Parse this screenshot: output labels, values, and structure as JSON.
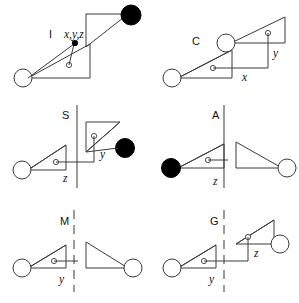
{
  "figure": {
    "background_color": "#ffffff",
    "line_color": "#3a3a3a",
    "filled_marker_color": "#000000",
    "open_marker_color": "#ffffff",
    "width": 299,
    "height": 303
  },
  "panels": [
    {
      "id": "panel-i",
      "operation_label": "I",
      "axis_labels": [
        "x,y,z"
      ],
      "divider": "none",
      "motifs": [
        {
          "name": "motif-base",
          "handedness": "right",
          "marker": "open-circle",
          "vertex_dot": "small-open-circle"
        },
        {
          "name": "motif-image",
          "handedness": "right",
          "marker": "filled-circle",
          "vertex_dot": "none"
        }
      ],
      "connector": "diagonal-with-center-dot",
      "center_marker": "filled-dot"
    },
    {
      "id": "panel-c",
      "operation_label": "C",
      "axis_labels": [
        "x",
        "y"
      ],
      "divider": "none",
      "motifs": [
        {
          "name": "motif-base",
          "handedness": "right",
          "marker": "open-circle",
          "vertex_dot": "small-open-circle"
        },
        {
          "name": "motif-image",
          "handedness": "right",
          "marker": "open-circle",
          "vertex_dot": "small-open-circle"
        }
      ],
      "connector": "stepped-xy"
    },
    {
      "id": "panel-s",
      "operation_label": "S",
      "axis_labels": [
        "z",
        "y"
      ],
      "divider": "solid-vertical",
      "motifs": [
        {
          "name": "motif-base",
          "handedness": "right",
          "marker": "open-circle",
          "vertex_dot": "small-open-circle"
        },
        {
          "name": "motif-image",
          "handedness": "right",
          "marker": "filled-circle",
          "vertex_dot": "small-open-circle"
        }
      ],
      "connector": "stepped-zy"
    },
    {
      "id": "panel-a",
      "operation_label": "A",
      "axis_labels": [
        "z"
      ],
      "divider": "solid-vertical",
      "motifs": [
        {
          "name": "motif-base",
          "handedness": "right",
          "marker": "filled-circle",
          "vertex_dot": "small-open-circle"
        },
        {
          "name": "motif-image",
          "handedness": "left",
          "marker": "open-circle",
          "vertex_dot": "none"
        }
      ],
      "connector": "horizontal-z"
    },
    {
      "id": "panel-m",
      "operation_label": "M",
      "axis_labels": [
        "y"
      ],
      "divider": "dashed-vertical",
      "motifs": [
        {
          "name": "motif-base",
          "handedness": "right",
          "marker": "open-circle",
          "vertex_dot": "small-open-circle"
        },
        {
          "name": "motif-image",
          "handedness": "left",
          "marker": "open-circle",
          "vertex_dot": "none"
        }
      ],
      "connector": "horizontal-y"
    },
    {
      "id": "panel-g",
      "operation_label": "G",
      "axis_labels": [
        "y",
        "z"
      ],
      "divider": "dashed-vertical",
      "motifs": [
        {
          "name": "motif-base",
          "handedness": "right",
          "marker": "open-circle",
          "vertex_dot": "small-open-circle"
        },
        {
          "name": "motif-image",
          "handedness": "right",
          "marker": "open-circle",
          "vertex_dot": "small-open-circle"
        }
      ],
      "connector": "stepped-yz"
    }
  ],
  "labels": {
    "i": "I",
    "i_coords": "x,y,z",
    "c": "C",
    "c_x": "x",
    "c_y": "y",
    "s": "S",
    "s_z": "z",
    "s_y": "y",
    "a": "A",
    "a_z": "z",
    "m": "M",
    "m_y": "y",
    "g": "G",
    "g_y": "y",
    "g_z": "z"
  }
}
